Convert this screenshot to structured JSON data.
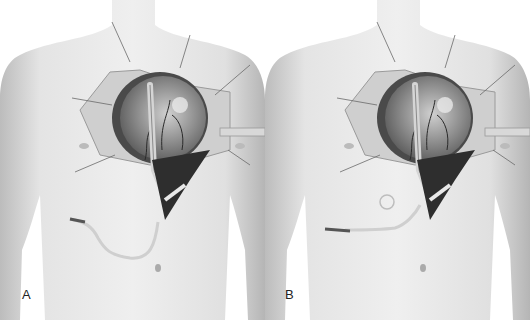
{
  "figure": {
    "panels": [
      {
        "label": "A",
        "caption": "Drain tube exiting below incision, looping down to the right side"
      },
      {
        "label": "B",
        "caption": "Drain tube with small coiled loop near incision, exiting laterally"
      }
    ],
    "colors": {
      "skin": "#e6e6e6",
      "skin_shadow": "#bdbdbd",
      "tissue": "#9a9a9a",
      "cavity": "#3a3a3a",
      "background": "#ffffff"
    }
  }
}
